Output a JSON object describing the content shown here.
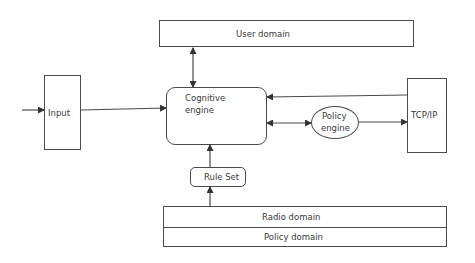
{
  "diagram": {
    "nodes": {
      "user_domain": {
        "label": "User domain",
        "shape": "rectangle"
      },
      "input": {
        "label": "Input",
        "shape": "rectangle"
      },
      "cognitive_engine": {
        "label_line1": "Cognitive",
        "label_line2": "engine",
        "shape": "rounded-rectangle"
      },
      "policy_engine": {
        "label_line1": "Policy",
        "label_line2": "engine",
        "shape": "ellipse"
      },
      "tcp_ip": {
        "label": "TCP/IP",
        "shape": "rectangle"
      },
      "rule_set": {
        "label": "Rule Set",
        "shape": "rounded-rectangle"
      },
      "radio_domain": {
        "label": "Radio domain",
        "shape": "rectangle"
      },
      "policy_domain": {
        "label": "Policy domain",
        "shape": "rectangle"
      }
    },
    "edges": [
      {
        "from": "external",
        "to": "Input",
        "direction": "forward"
      },
      {
        "from": "Input",
        "to": "Cognitive engine",
        "direction": "forward"
      },
      {
        "from": "User domain",
        "to": "Cognitive engine",
        "direction": "bidirectional"
      },
      {
        "from": "TCP/IP",
        "to": "Cognitive engine",
        "direction": "forward"
      },
      {
        "from": "Cognitive engine",
        "to": "Policy engine",
        "direction": "bidirectional"
      },
      {
        "from": "Policy engine",
        "to": "TCP/IP",
        "direction": "forward"
      },
      {
        "from": "Rule Set",
        "to": "Cognitive engine",
        "direction": "forward"
      },
      {
        "from": "Radio domain",
        "to": "Rule Set",
        "direction": "forward"
      }
    ],
    "colors": {
      "stroke": "#4a4a4a",
      "text": "#3a3a3a",
      "background": "#ffffff"
    }
  }
}
